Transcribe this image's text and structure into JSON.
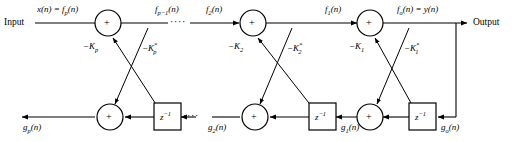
{
  "diagram": {
    "type": "signal-flow-diagram",
    "width": 515,
    "height": 142,
    "background_color": "#ffffff",
    "line_color": "#000000",
    "io": {
      "input_label": "Input",
      "output_label": "Output"
    },
    "forward_signals": [
      {
        "id": "f_p",
        "label": "x(n) = f",
        "sub": "p",
        "tail": "(n)"
      },
      {
        "id": "f_pm1",
        "label": "f",
        "sub": "p−1",
        "tail": "(n)"
      },
      {
        "id": "f_2",
        "label": "f",
        "sub": "2",
        "tail": "(n)"
      },
      {
        "id": "f_1",
        "label": "f",
        "sub": "1",
        "tail": "(n)"
      },
      {
        "id": "f_o",
        "label": "f",
        "sub": "o",
        "tail": "(n) = y(n)"
      }
    ],
    "backward_signals": [
      {
        "id": "g_p",
        "label": "g",
        "sub": "p",
        "tail": "(n)"
      },
      {
        "id": "g_2",
        "label": "g",
        "sub": "2",
        "tail": "(n)"
      },
      {
        "id": "g_1",
        "label": "g",
        "sub": "1",
        "tail": "(n)"
      },
      {
        "id": "g_o",
        "label": "g",
        "sub": "o",
        "tail": "(n)"
      }
    ],
    "coefficients": [
      {
        "id": "k_p",
        "label": "−K",
        "sub": "p",
        "star": ""
      },
      {
        "id": "k_p_star",
        "label": "−K",
        "sub": "p",
        "star": "*"
      },
      {
        "id": "k_2",
        "label": "−K",
        "sub": "2",
        "star": ""
      },
      {
        "id": "k_2_star",
        "label": "−K",
        "sub": "2",
        "star": "*"
      },
      {
        "id": "k_1",
        "label": "−K",
        "sub": "1",
        "star": ""
      },
      {
        "id": "k_1_star",
        "label": "−K",
        "sub": "1",
        "star": "*"
      }
    ],
    "adders": [
      {
        "id": "adder-top-p",
        "symbol": "+",
        "row": "top",
        "stage": "p"
      },
      {
        "id": "adder-top-2",
        "symbol": "+",
        "row": "top",
        "stage": "2"
      },
      {
        "id": "adder-top-1",
        "symbol": "+",
        "row": "top",
        "stage": "1"
      },
      {
        "id": "adder-bottom-p",
        "symbol": "+",
        "row": "bottom",
        "stage": "p"
      },
      {
        "id": "adder-bottom-2",
        "symbol": "+",
        "row": "bottom",
        "stage": "2"
      },
      {
        "id": "adder-bottom-1",
        "symbol": "+",
        "row": "bottom",
        "stage": "1"
      }
    ],
    "delays": [
      {
        "id": "delay-p",
        "base": "z",
        "exp": "−1"
      },
      {
        "id": "delay-2",
        "base": "z",
        "exp": "−1"
      },
      {
        "id": "delay-1",
        "base": "z",
        "exp": "−1"
      }
    ],
    "ellipses": [
      {
        "id": "ellipsis-top",
        "text": "····"
      },
      {
        "id": "ellipsis-bottom",
        "text": "····"
      }
    ]
  }
}
